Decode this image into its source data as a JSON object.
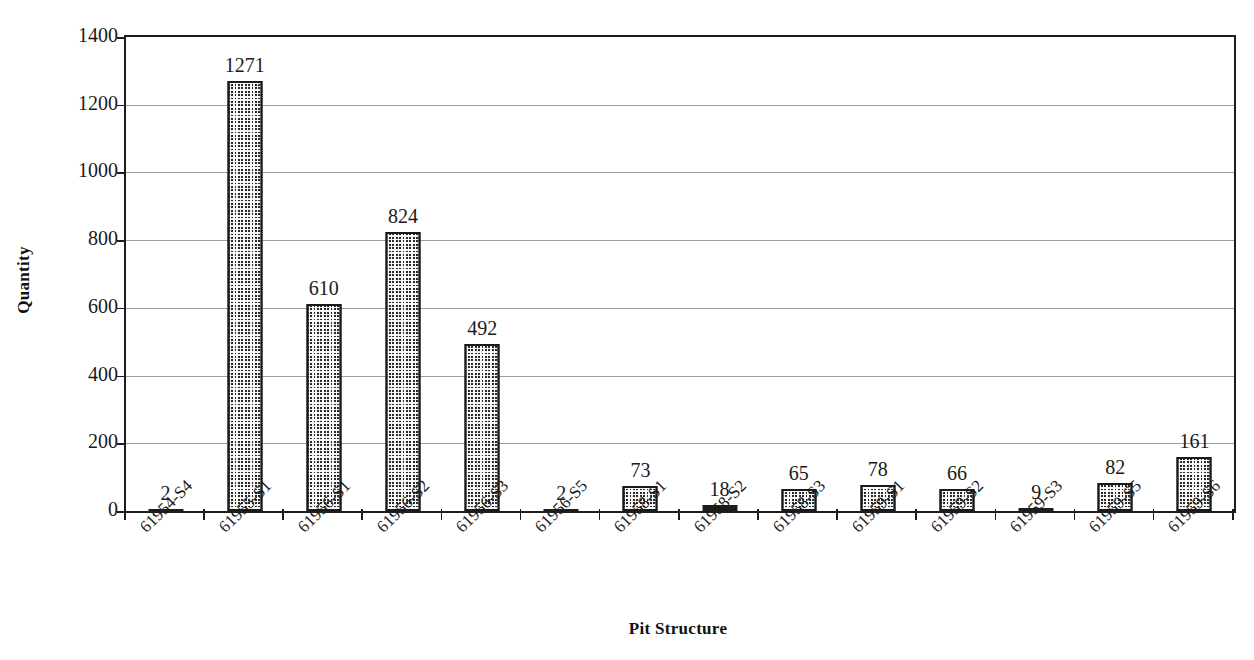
{
  "chart_data": {
    "type": "bar",
    "title": "",
    "xlabel": "Pit Structure",
    "ylabel": "Quantity",
    "ylim": [
      0,
      1400
    ],
    "ytick_step": 200,
    "yticks": [
      0,
      200,
      400,
      600,
      800,
      1000,
      1200,
      1400
    ],
    "grid": true,
    "legend": "none",
    "show_value_labels": true,
    "categories": [
      "61954-S4",
      "61955-S1",
      "61956-S1",
      "61956-S2",
      "61956-S3",
      "61956-S5",
      "61958-S1",
      "61958-S2",
      "61958-S3",
      "61959-S1",
      "61959-S2",
      "61959-S3",
      "61959-S5",
      "61959-S6"
    ],
    "values": [
      2,
      1271,
      610,
      824,
      492,
      2,
      73,
      18,
      65,
      78,
      66,
      9,
      82,
      161
    ],
    "value_labels": [
      "2",
      "1271",
      "610",
      "824",
      "492",
      "2",
      "73",
      "18",
      "65",
      "78",
      "66",
      "9",
      "82",
      "161"
    ],
    "series_name": "Quantity",
    "bar_fill": "#2b2b2b",
    "bar_pattern": "fine-checkerboard",
    "bar_border_color": "#191919",
    "axis_color": "#1d1d1d",
    "gridline_color": "#8d8d8d",
    "background": "#ffffff"
  },
  "axes": {
    "y_title": "Quantity",
    "x_title": "Pit Structure"
  }
}
